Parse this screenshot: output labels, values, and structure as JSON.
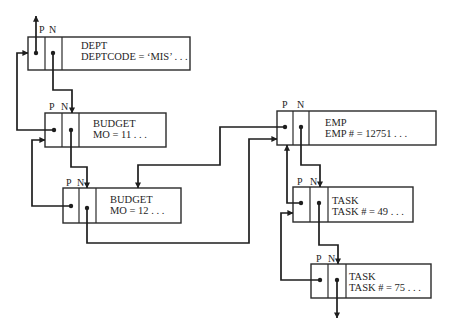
{
  "diagram": {
    "type": "linked-list-records",
    "pointer_labels": {
      "prior": "P",
      "next": "N"
    },
    "nodes": [
      {
        "id": "dept",
        "record_type": "DEPT",
        "field": "DEPTCODE = ‘MIS’   . . ."
      },
      {
        "id": "budget11",
        "record_type": "BUDGET",
        "field": "MO = 11   . . ."
      },
      {
        "id": "budget12",
        "record_type": "BUDGET",
        "field": "MO = 12   . . ."
      },
      {
        "id": "emp",
        "record_type": "EMP",
        "field": "EMP # = 12751   . . ."
      },
      {
        "id": "task49",
        "record_type": "TASK",
        "field": "TASK # = 49   . . ."
      },
      {
        "id": "task75",
        "record_type": "TASK",
        "field": "TASK # = 75   . . ."
      }
    ],
    "edges": [
      {
        "from": "dept.P",
        "to": "outside-up"
      },
      {
        "from": "dept.N",
        "to": "budget11"
      },
      {
        "from": "budget11.P",
        "to": "dept"
      },
      {
        "from": "budget11.N",
        "to": "budget12"
      },
      {
        "from": "budget12.P",
        "to": "budget11"
      },
      {
        "from": "budget12.N",
        "to": "emp"
      },
      {
        "from": "emp.P",
        "to": "budget12"
      },
      {
        "from": "emp.N",
        "to": "task49"
      },
      {
        "from": "task49.P",
        "to": "emp"
      },
      {
        "from": "task49.N",
        "to": "task75"
      },
      {
        "from": "task75.P",
        "to": "task49"
      },
      {
        "from": "task75.N",
        "to": "outside-down"
      }
    ],
    "colors": {
      "line": "#1e1e1e",
      "box": "#2a2a2a",
      "background": "#ffffff"
    }
  }
}
